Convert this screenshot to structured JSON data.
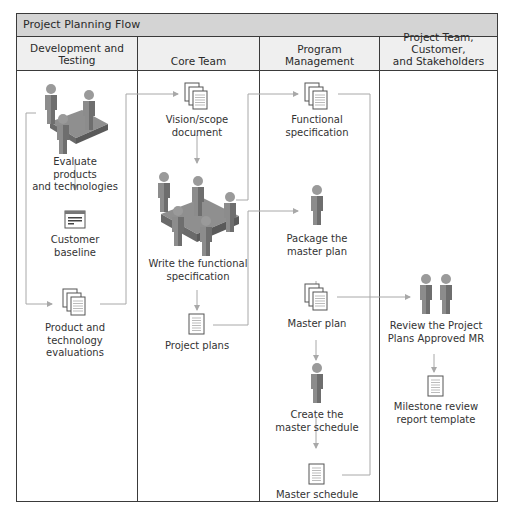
{
  "diagram": {
    "title": "Project Planning Flow",
    "lanes": [
      {
        "id": "dev",
        "label": "Development and\nTesting"
      },
      {
        "id": "core",
        "label": "Core Team"
      },
      {
        "id": "pm",
        "label": "Program\nManagement"
      },
      {
        "id": "stake",
        "label": "Project Team, Customer,\nand Stakeholders"
      }
    ],
    "nodes": {
      "evaluate": {
        "label": "Evaluate products\nand technologies",
        "icon": "team-meeting-icon"
      },
      "baseline": {
        "label": "Customer\nbaseline",
        "icon": "form-window-icon"
      },
      "evaluations": {
        "label": "Product and\ntechnology\nevaluations",
        "icon": "document-stack-icon"
      },
      "vision": {
        "label": "Vision/scope\ndocument",
        "icon": "document-stack-icon"
      },
      "write_spec": {
        "label": "Write the functional\nspecification",
        "icon": "team-meeting-icon"
      },
      "project_plans": {
        "label": "Project plans",
        "icon": "document-icon"
      },
      "func_spec": {
        "label": "Functional\nspecification",
        "icon": "document-stack-icon"
      },
      "package": {
        "label": "Package the\nmaster plan",
        "icon": "person-icon"
      },
      "master_plan": {
        "label": "Master plan",
        "icon": "document-stack-icon"
      },
      "create_schedule": {
        "label": "Create the\nmaster schedule",
        "icon": "person-icon"
      },
      "master_schedule": {
        "label": "Master schedule",
        "icon": "document-icon"
      },
      "review": {
        "label": "Review the Project\nPlans Approved MR",
        "icon": "two-people-icon"
      },
      "milestone": {
        "label": "Milestone review\nreport template",
        "icon": "document-icon"
      }
    },
    "colors": {
      "border": "#3a3a3a",
      "title_bg": "#d4d4d4",
      "header_bg": "#efefef",
      "connector": "#a8a8a8",
      "figure": "#8a8a8a"
    }
  }
}
